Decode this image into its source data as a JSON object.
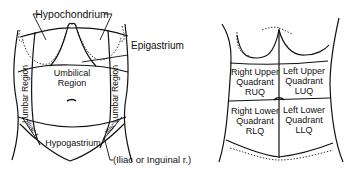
{
  "left_figure": {
    "title": "Nine abdominal regions",
    "labels": {
      "hypochondrium": "Hypochondrium",
      "epigastrium": "Epigastrium",
      "umbilical_line1": "Umbilical",
      "umbilical_line2": "Region",
      "lumbar_left": "Lumbar Region",
      "lumbar_right": "Lumbar Region",
      "iliac_left": "Iliac r.",
      "iliac_right": "Iliac",
      "hypogastrium": "Hypogastrium",
      "iliac_inguinal": "(Iliac or Inguinal r.)"
    }
  },
  "right_figure": {
    "title": "Four abdominal quadrants",
    "quadrants": [
      {
        "line1": "Right Upper",
        "line2": "Quadrant",
        "abbr": "RUQ"
      },
      {
        "line1": "Left Upper",
        "line2": "Quadrant",
        "abbr": "LUQ"
      },
      {
        "line1": "Right Lower",
        "line2": "Quadrant",
        "abbr": "RLQ"
      },
      {
        "line1": "Left Lower",
        "line2": "Quadrant",
        "abbr": "LLQ"
      }
    ]
  }
}
